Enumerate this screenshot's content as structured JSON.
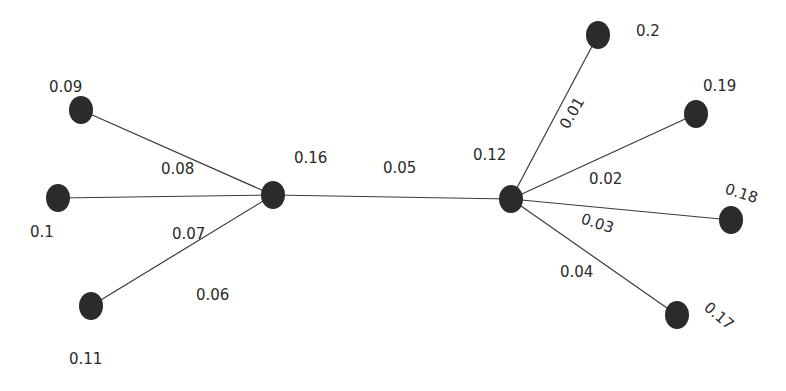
{
  "diagram": {
    "type": "tree",
    "colors": {
      "node": "#2b2b2b",
      "edge": "#3a3a3a",
      "text": "#2a2a2a",
      "background": "#ffffff"
    },
    "nodes": [
      {
        "id": "n1",
        "label": "0.09",
        "x": 81,
        "y": 110,
        "rx": 12,
        "ry": 14,
        "lx": 49,
        "ly": 92,
        "rot": 0
      },
      {
        "id": "n2",
        "label": "0.1",
        "x": 58,
        "y": 198,
        "rx": 12,
        "ry": 14,
        "lx": 30,
        "ly": 237,
        "rot": 0
      },
      {
        "id": "n3",
        "label": "0.11",
        "x": 91,
        "y": 306,
        "rx": 12,
        "ry": 14,
        "lx": 69,
        "ly": 364,
        "rot": 0
      },
      {
        "id": "n4",
        "label": "0.16",
        "x": 273,
        "y": 195,
        "rx": 12,
        "ry": 14,
        "lx": 294,
        "ly": 163,
        "rot": 0
      },
      {
        "id": "n5",
        "label": "0.12",
        "x": 511,
        "y": 199,
        "rx": 12,
        "ry": 14,
        "lx": 473,
        "ly": 160,
        "rot": 0
      },
      {
        "id": "n6",
        "label": "0.2",
        "x": 598,
        "y": 35,
        "rx": 12,
        "ry": 14,
        "lx": 636,
        "ly": 36,
        "rot": 0
      },
      {
        "id": "n7",
        "label": "0.19",
        "x": 696,
        "y": 114,
        "rx": 12,
        "ry": 14,
        "lx": 703,
        "ly": 91,
        "rot": 0
      },
      {
        "id": "n8",
        "label": "0.18",
        "x": 731,
        "y": 220,
        "rx": 12,
        "ry": 14,
        "lx": 724,
        "ly": 193,
        "rot": 18
      },
      {
        "id": "n9",
        "label": "0.17",
        "x": 677,
        "y": 315,
        "rx": 12,
        "ry": 14,
        "lx": 703,
        "ly": 309,
        "rot": 40
      }
    ],
    "edges": [
      {
        "from": "n1",
        "to": "n4",
        "label": "0.08",
        "lx": 161,
        "ly": 174,
        "rot": 0
      },
      {
        "from": "n2",
        "to": "n4",
        "label": "0.1_edge_hidden",
        "lx": 0,
        "ly": 0,
        "rot": 0,
        "hidden_label": true
      },
      {
        "from": "n3",
        "to": "n4",
        "label": "0.07",
        "lx": 172,
        "ly": 239,
        "rot": 0
      },
      {
        "from": "n4",
        "to": "n5",
        "label": "0.05",
        "lx": 383,
        "ly": 173,
        "rot": 0
      },
      {
        "from": "n5",
        "to": "n6",
        "label": "0.01",
        "lx": 568,
        "ly": 130,
        "rot": -60
      },
      {
        "from": "n5",
        "to": "n7",
        "label": "0.02",
        "lx": 589,
        "ly": 184,
        "rot": 0
      },
      {
        "from": "n5",
        "to": "n8",
        "label": "",
        "lx": 0,
        "ly": 0,
        "rot": 0
      },
      {
        "from": "n5",
        "to": "n9",
        "label": "0.03",
        "lx": 580,
        "ly": 223,
        "rot": 18
      }
    ],
    "free_labels": [
      {
        "id": "l-006",
        "label": "0.06",
        "lx": 196,
        "ly": 300,
        "rot": 0
      },
      {
        "id": "l-004",
        "label": "0.04",
        "lx": 560,
        "ly": 277,
        "rot": 0
      }
    ]
  }
}
